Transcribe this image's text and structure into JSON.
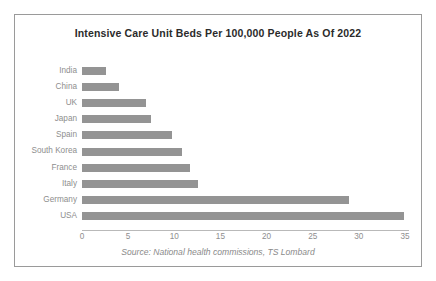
{
  "chart_data": {
    "type": "bar",
    "orientation": "horizontal",
    "title": "Intensive Care Unit Beds Per 100,000 People As Of 2022",
    "xlabel": "",
    "ylabel": "",
    "xlim": [
      0,
      35
    ],
    "categories": [
      "India",
      "China",
      "UK",
      "Japan",
      "Spain",
      "South Korea",
      "France",
      "Italy",
      "Germany",
      "USA"
    ],
    "values": [
      2.6,
      4.0,
      6.9,
      7.5,
      9.8,
      10.8,
      11.7,
      12.6,
      28.9,
      34.9
    ],
    "xticks": [
      "0",
      "5",
      "10",
      "15",
      "20",
      "25",
      "30",
      "35"
    ],
    "xtick_values": [
      0,
      5,
      10,
      15,
      20,
      25,
      30,
      35
    ],
    "grid": false,
    "legend": false,
    "source_note": "Source: National health commissions, TS Lombard",
    "bar_color": "#949494",
    "label_color": "#8e8e8e",
    "title_color": "#2b2b2b",
    "border_color": "#9a9a9a",
    "background_color": "#ffffff"
  }
}
